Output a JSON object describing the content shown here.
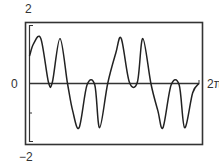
{
  "chart_data": {
    "type": "line",
    "title": "",
    "xlabel": "",
    "ylabel": "",
    "xlim": [
      0,
      6.2832
    ],
    "ylim": [
      -2,
      2
    ],
    "tick_labels": {
      "y_top": "2",
      "y_bottom": "−2",
      "x_origin": "0",
      "x_right": "2π"
    },
    "grid": false,
    "legend": null,
    "series": [
      {
        "name": "f(x)",
        "x": [
          0,
          0.15,
          0.42,
          0.7,
          0.85,
          1.13,
          1.41,
          1.6,
          1.84,
          2.13,
          2.42,
          2.6,
          2.9,
          3.2,
          3.4,
          3.7,
          4.0,
          4.2,
          4.5,
          4.76,
          4.95,
          5.25,
          5.55,
          5.75,
          6.05,
          6.28
        ],
        "y": [
          0.9,
          1.3,
          1.48,
          0.05,
          0.05,
          1.48,
          0.0,
          -0.9,
          -1.45,
          -0.05,
          -0.05,
          -1.45,
          0.0,
          1.0,
          1.48,
          0.05,
          0.05,
          1.48,
          0.0,
          -0.9,
          -1.45,
          -0.05,
          -0.05,
          -1.45,
          -0.3,
          0.0
        ]
      }
    ]
  },
  "colors": {
    "line": "#222222",
    "frame": "#333333",
    "background": "#ffffff"
  }
}
